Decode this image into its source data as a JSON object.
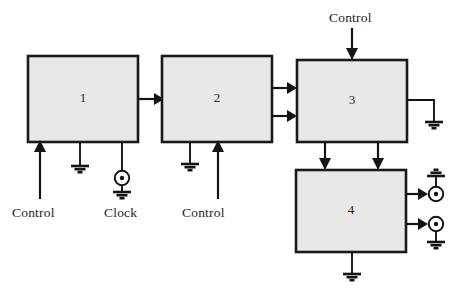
{
  "diagram": {
    "background_color": "#ffffff",
    "block_fill_color": "#e8e8e6",
    "line_color": "#141414",
    "blocks": [
      {
        "id": "block-1",
        "label": "1",
        "x": 28,
        "y": 56,
        "w": 110,
        "h": 86
      },
      {
        "id": "block-2",
        "label": "2",
        "x": 162,
        "y": 56,
        "w": 110,
        "h": 86
      },
      {
        "id": "block-3",
        "label": "3",
        "x": 297,
        "y": 60,
        "w": 110,
        "h": 82
      },
      {
        "id": "block-4",
        "label": "4",
        "x": 296,
        "y": 170,
        "w": 110,
        "h": 82
      }
    ],
    "labels": [
      {
        "id": "label-control-1",
        "text": "Control",
        "x": 12,
        "y": 205
      },
      {
        "id": "label-clock",
        "text": "Clock",
        "x": 104,
        "y": 205
      },
      {
        "id": "label-control-2",
        "text": "Control",
        "x": 182,
        "y": 205
      },
      {
        "id": "label-control-3",
        "text": "Control",
        "x": 329,
        "y": 10
      }
    ],
    "symbols": {
      "ground": "ground-symbol",
      "terminal": "terminal-circle-dot-symbol",
      "arrow": "arrow-head"
    },
    "signal_flow": [
      "block-1 -> block-2",
      "block-2 -> block-3 (two lines)",
      "block-3 -> block-4 (two lines)",
      "block-4 -> output terminal top",
      "block-4 -> output terminal bottom",
      "block-3 -> ground (right side)"
    ]
  }
}
